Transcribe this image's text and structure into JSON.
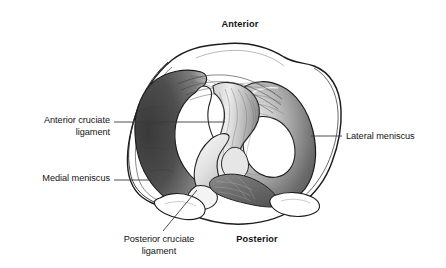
{
  "figure": {
    "orientation_labels": {
      "anterior": "Anterior",
      "posterior": "Posterior"
    },
    "labels": [
      {
        "id": "anterior-cruciate-ligament",
        "text": "Anterior cruciate\nligament",
        "align": "right",
        "bold": false
      },
      {
        "id": "medial-meniscus",
        "text": "Medial meniscus",
        "align": "right",
        "bold": false
      },
      {
        "id": "lateral-meniscus",
        "text": "Lateral meniscus",
        "align": "left",
        "bold": false
      },
      {
        "id": "posterior-cruciate-ligament",
        "text": "Posterior cruciate\nligament",
        "align": "center",
        "bold": false
      },
      {
        "id": "anterior",
        "text": "Anterior",
        "align": "center",
        "bold": true
      },
      {
        "id": "posterior",
        "text": "Posterior",
        "align": "center",
        "bold": true
      }
    ],
    "label_text": {
      "anterior_cruciate_ligament": "Anterior cruciate\nligament",
      "medial_meniscus": "Medial meniscus",
      "lateral_meniscus": "Lateral meniscus",
      "posterior_cruciate_ligament": "Posterior cruciate\nligament",
      "anterior": "Anterior",
      "posterior": "Posterior"
    },
    "colors": {
      "background": "#ffffff",
      "outline": "#1a1a1a",
      "meniscus_dark": "#4a4a4a",
      "meniscus_mid": "#8d8d8d",
      "meniscus_light": "#d8d8d8",
      "cartilage_fill": "#ffffff",
      "ligament_fill": "#e8e8e8",
      "ligament_shade": "#9a9a9a",
      "leader_line": "#3a3a3a",
      "text": "#141414"
    },
    "leader_lines": [
      {
        "id": "acl-leader",
        "x1": 114,
        "y1": 122,
        "x2": 225,
        "y2": 122
      },
      {
        "id": "medial-leader",
        "x1": 114,
        "y1": 180,
        "x2": 152,
        "y2": 180
      },
      {
        "id": "lateral-leader",
        "x1": 311,
        "y1": 136,
        "x2": 342,
        "y2": 136
      },
      {
        "id": "pcl-leader",
        "x1": 197,
        "y1": 190,
        "x2": 163,
        "y2": 231
      }
    ]
  }
}
